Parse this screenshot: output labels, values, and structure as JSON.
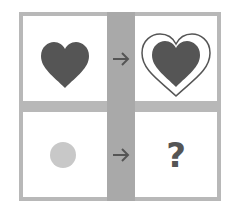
{
  "colors": {
    "frame": "#b8b8b8",
    "band": "#a9a9a9",
    "cell_bg": "#ffffff",
    "heart_fill": "#555555",
    "circle_fill": "#c8c8c8",
    "arrow": "#555555"
  },
  "cells": [
    {
      "position": "top-left",
      "content": "filled dark heart"
    },
    {
      "position": "top-right",
      "content": "filled dark heart with outline border"
    },
    {
      "position": "bottom-left",
      "content": "filled light gray circle"
    },
    {
      "position": "bottom-right",
      "content": "question mark",
      "text": "?"
    }
  ],
  "arrows": [
    "right-arrow",
    "right-arrow"
  ]
}
